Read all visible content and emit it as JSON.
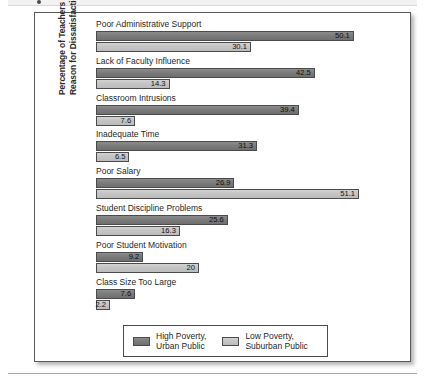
{
  "figure": {
    "yaxis_title_line1": "Percentage of Teachers Giving",
    "yaxis_title_line2": "Reason for Dissatisfaction"
  },
  "legend": {
    "items": [
      {
        "label_line1": "High Poverty,",
        "label_line2": "Urban Public",
        "color": "#7b7b7b"
      },
      {
        "label_line1": "Low Poverty,",
        "label_line2": "Suburban Public",
        "color": "#c4c4c4"
      }
    ]
  },
  "chart_data": {
    "type": "bar",
    "orientation": "horizontal",
    "title": "",
    "xlabel": "",
    "ylabel": "Percentage of Teachers Giving Reason for Dissatisfaction",
    "xlim": [
      0,
      51.1
    ],
    "grid": false,
    "legend_position": "bottom-center",
    "categories": [
      "Poor Administrative Support",
      "Lack of Faculty Influence",
      "Classroom Intrusions",
      "Inadequate Time",
      "Poor Salary",
      "Student Discipline Problems",
      "Poor Student Motivation",
      "Class Size Too Large"
    ],
    "series": [
      {
        "name": "High Poverty, Urban Public",
        "color": "#7b7b7b",
        "values": [
          50.1,
          42.5,
          39.4,
          31.3,
          26.9,
          25.6,
          9.2,
          7.6
        ],
        "labels": [
          "50.1",
          "42.5",
          "39.4",
          "31.3",
          "26.9",
          "25.6",
          "9.2",
          "7.6"
        ]
      },
      {
        "name": "Low Poverty, Suburban Public",
        "color": "#c4c4c4",
        "values": [
          30.1,
          14.3,
          7.6,
          6.5,
          51.1,
          16.3,
          20,
          2.2
        ],
        "labels": [
          "30.1",
          "14.3",
          "7.6",
          "6.5",
          "51.1",
          "16.3",
          "20",
          "2.2"
        ]
      }
    ]
  }
}
